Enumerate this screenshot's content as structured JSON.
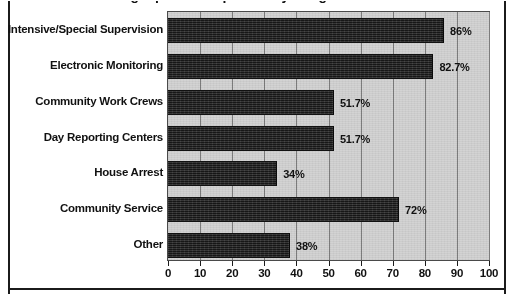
{
  "figure": {
    "title_clipped": "Sentencing Options Reported by Programs",
    "background_color": "#ffffff",
    "plot_background_color": "#d3d3d3",
    "bar_color": "#262626",
    "gridline_color": "#7d7d7d"
  },
  "chart_data": {
    "type": "bar",
    "orientation": "horizontal",
    "title": "",
    "xlabel": "",
    "ylabel": "",
    "xlim": [
      0,
      100
    ],
    "xticks": [
      0,
      10,
      20,
      30,
      40,
      50,
      60,
      70,
      80,
      90,
      100
    ],
    "xtick_labels": [
      "0",
      "10",
      "20",
      "30",
      "40",
      "50",
      "60",
      "70",
      "80",
      "90",
      "100"
    ],
    "grid": true,
    "legend": false,
    "categories": [
      "Intensive/Special Supervision",
      "Electronic Monitoring",
      "Community Work Crews",
      "Day Reporting Centers",
      "House Arrest",
      "Community Service",
      "Other"
    ],
    "values": [
      86,
      82.7,
      51.7,
      51.7,
      34,
      72,
      38
    ],
    "value_labels": [
      "86%",
      "82.7%",
      "51.7%",
      "51.7%",
      "34%",
      "72%",
      "38%"
    ]
  }
}
